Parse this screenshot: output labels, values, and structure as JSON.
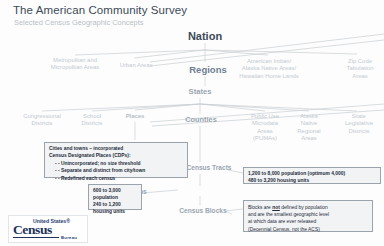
{
  "header": {
    "title": "The American Community Survey",
    "subtitle": "Selected Census Geographic Concepts"
  },
  "hierarchy": {
    "nation": "Nation",
    "regions": "Regions",
    "states": "States",
    "counties": "Counties",
    "census_tracts": "Census Tracts",
    "block_groups": "Block Groups",
    "census_blocks": "Census Blocks"
  },
  "branches": {
    "metro": "Metropolitan and\nMicropolitan Areas",
    "urban": "Urban Areas",
    "aian": "American Indian/\nAlaska Native Areas/\nHawaiian Home Lands",
    "zcta": "Zip Code\nTabulation\nAreas",
    "congressional": "Congressional\nDistricts",
    "school": "School\nDistricts",
    "places": "Places",
    "pumas": "Public Use\nMicrodata\nAreas\n(PUMAs)",
    "alaska_native": "Alaska\nNative\nRegional\nAreas",
    "state_legislative": "State\nLegislative\nDistricts"
  },
  "callouts": {
    "places": {
      "b1": "Cities and towns – incorporated",
      "b2": "Census Designated Places  (CDPs):",
      "s1": "- -  Unincorporated; no size threshold",
      "s2": "- -  Separate and distinct from city/town",
      "s3": "- -  Redefined each census"
    },
    "tracts": {
      "l1": "1,200 to 8,000 population (optimum 4,000)",
      "l2": "480 to 3,200 housing units"
    },
    "block_groups": {
      "l1": "600 to 3,000",
      "l2": "population",
      "l3": "240 to 1,200",
      "l4": "housing units"
    },
    "blocks": {
      "p1": "Blocks are ",
      "em": "not",
      "p2": " defined by population",
      "l2": "and are the smallest geographic level",
      "l3": "at which data are ever released",
      "l4": "(Decennial Census, not the ACS)"
    }
  },
  "logo": {
    "united_states": "United States®",
    "census": "Census",
    "bureau": "Bureau"
  },
  "colors": {
    "title": "#3c4a58",
    "subtitle": "#b8c0c7",
    "node_gray": "#9aa6b1",
    "regions_blue": "#6e7f91",
    "box_fill": "#f2f3f4",
    "box_border": "#9aa3ab",
    "logo_navy": "#21325b",
    "line": "#c9ced3"
  }
}
